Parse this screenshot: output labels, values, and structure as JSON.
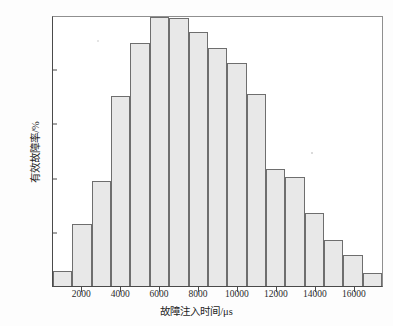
{
  "chart_data": {
    "type": "bar",
    "title": "",
    "subtitle": "",
    "xlabel": "故障注入时间/μs",
    "ylabel": "有效故障率/%",
    "xlim": [
      500,
      17500
    ],
    "ylim": [
      0,
      100
    ],
    "grid": false,
    "legend": null,
    "bin_width": 1000,
    "x": [
      1000,
      2000,
      3000,
      4000,
      5000,
      6000,
      7000,
      8000,
      9000,
      10000,
      11000,
      12000,
      13000,
      14000,
      15000,
      16000,
      17000
    ],
    "categories": [
      "1000",
      "2000",
      "3000",
      "4000",
      "5000",
      "6000",
      "7000",
      "8000",
      "9000",
      "10000",
      "11000",
      "12000",
      "13000",
      "14000",
      "15000",
      "16000",
      "17000"
    ],
    "values": [
      5.5,
      23.0,
      39.0,
      70.5,
      90.5,
      100.0,
      99.5,
      94.5,
      88.5,
      83.0,
      71.5,
      43.5,
      40.5,
      27.0,
      17.0,
      11.5,
      5.0
    ],
    "yticks": [
      0,
      20,
      40,
      60,
      80,
      100
    ],
    "ytick_labels": [
      "0.00",
      "20.00",
      "40.00",
      "60.00",
      "80.00",
      "100.00"
    ],
    "xticks": [
      2000,
      4000,
      6000,
      8000,
      10000,
      12000,
      14000,
      16000
    ],
    "xtick_labels": [
      "2000",
      "4000",
      "6000",
      "8000",
      "10000",
      "12000",
      "14000",
      "16000"
    ],
    "bar_fill": "#e8e8e8",
    "bar_edge": "#6e6e6e",
    "axis_color": "#4a4a4a",
    "background": "#ffffff"
  }
}
